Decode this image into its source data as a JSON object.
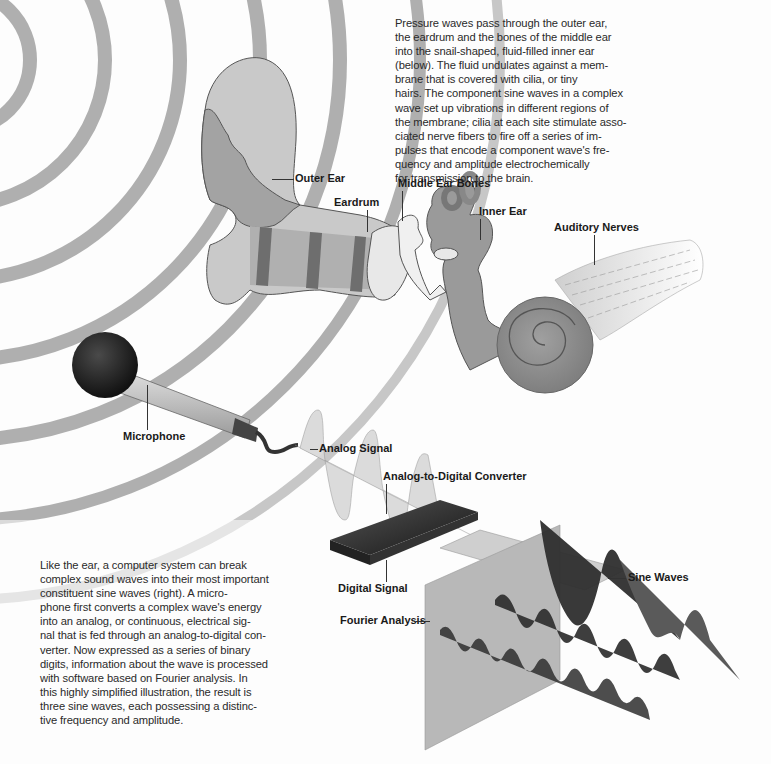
{
  "top_caption": {
    "lines": [
      "Pressure waves pass through the outer ear,",
      "the eardrum and the bones of the middle ear",
      "into the snail-shaped, fluid-filled inner ear",
      "(below). The fluid undulates against a mem-",
      "brane that is covered with cilia, or tiny",
      "hairs. The component sine waves in a complex",
      "wave set up vibrations in different regions of",
      "the membrane; cilia at each site stimulate asso-",
      "ciated nerve fibers to fire off a series of im-",
      "pulses that encode a component wave's fre-",
      "quency and amplitude electrochemically",
      "for transmission to the brain."
    ]
  },
  "bottom_caption": {
    "lines": [
      "Like the ear, a computer system can break",
      "complex sound waves into their most important",
      "constituent sine waves (right). A micro-",
      "phone first converts a complex wave's energy",
      "into an analog, or continuous, electrical sig-",
      "nal that is fed through an analog-to-digital con-",
      "verter. Now expressed as a series of binary",
      "digits, information about the wave is processed",
      "with software based on Fourier analysis. In",
      "this highly simplified illustration, the result is",
      "three sine waves, each possessing a distinc-",
      "tive frequency and amplitude."
    ]
  },
  "labels": {
    "outer_ear": "Outer Ear",
    "eardrum": "Eardrum",
    "middle_ear_bones": "Middle Ear Bones",
    "inner_ear": "Inner Ear",
    "auditory_nerves": "Auditory Nerves",
    "microphone": "Microphone",
    "analog_signal": "Analog Signal",
    "adc": "Analog-to-Digital Converter",
    "digital_signal": "Digital Signal",
    "fourier_analysis": "Fourier Analysis",
    "sine_waves": "Sine Waves"
  },
  "binary_digits": [
    "1 0 1 0 0 1",
    "0 1 0 1 0 1",
    "1 1 0 1 0 0",
    "0 1 1 0 1 1",
    "1 0 0 1 0 1"
  ],
  "colors": {
    "sound_wave_rings": "#9a9a9a",
    "ear_tissue": "#a8a8a8",
    "ear_tissue_light": "#c8c8c8",
    "ear_bands": "#6e6e6e",
    "cochlea": "#8e8e8e",
    "microphone_head": "#1e1e1e",
    "fourier_panel": "#b4b4b4",
    "sine_wave_fill": "#2e2e2e",
    "text": "#2a2a2a"
  }
}
